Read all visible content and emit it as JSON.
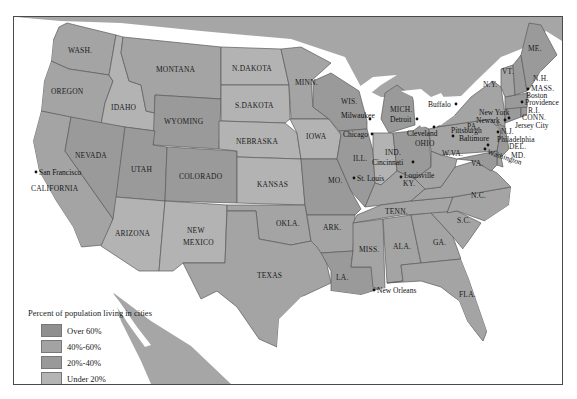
{
  "legend": {
    "title": "Percent of population living in cities",
    "items": [
      {
        "label": "Over 60%",
        "color": "#8f8f8f"
      },
      {
        "label": "40%-60%",
        "color": "#a3a3a3"
      },
      {
        "label": "20%-40%",
        "color": "#999999"
      },
      {
        "label": "Under 20%",
        "color": "#b4b4b4"
      }
    ],
    "cities_note": "Cities with population over 100,000"
  },
  "colors": {
    "over60": "#8e8e8e",
    "40to60": "#a4a4a4",
    "20to40": "#9a9a9a",
    "under20": "#b3b3b3",
    "water": "#ffffff"
  },
  "states": [
    {
      "name": "WASH.",
      "category": "40to60"
    },
    {
      "name": "OREGON",
      "category": "40to60"
    },
    {
      "name": "CALIFORNIA",
      "category": "40to60"
    },
    {
      "name": "IDAHO",
      "category": "under20"
    },
    {
      "name": "NEVADA",
      "category": "20to40"
    },
    {
      "name": "MONTANA",
      "category": "40to60"
    },
    {
      "name": "WYOMING",
      "category": "20to40"
    },
    {
      "name": "UTAH",
      "category": "20to40"
    },
    {
      "name": "COLORADO",
      "category": "20to40"
    },
    {
      "name": "ARIZONA",
      "category": "under20"
    },
    {
      "name": "NEW MEXICO",
      "category": "under20"
    },
    {
      "name": "N.DAKOTA",
      "category": "under20"
    },
    {
      "name": "S.DAKOTA",
      "category": "under20"
    },
    {
      "name": "NEBRASKA",
      "category": "under20"
    },
    {
      "name": "KANSAS",
      "category": "under20"
    },
    {
      "name": "OKLA.",
      "category": "40to60"
    },
    {
      "name": "TEXAS",
      "category": "40to60"
    },
    {
      "name": "MINN.",
      "category": "40to60"
    },
    {
      "name": "IOWA",
      "category": "under20"
    },
    {
      "name": "MO.",
      "category": "20to40"
    },
    {
      "name": "ARK.",
      "category": "40to60"
    },
    {
      "name": "LA.",
      "category": "20to40"
    },
    {
      "name": "WIS.",
      "category": "20to40"
    },
    {
      "name": "ILL.",
      "category": "20to40"
    },
    {
      "name": "MICH.",
      "category": "20to40"
    },
    {
      "name": "IND.",
      "category": "under20"
    },
    {
      "name": "OHIO",
      "category": "20to40"
    },
    {
      "name": "KY.",
      "category": "40to60"
    },
    {
      "name": "TENN.",
      "category": "40to60"
    },
    {
      "name": "MISS.",
      "category": "40to60"
    },
    {
      "name": "ALA.",
      "category": "40to60"
    },
    {
      "name": "GA.",
      "category": "40to60"
    },
    {
      "name": "FLA.",
      "category": "40to60"
    },
    {
      "name": "S.C.",
      "category": "40to60"
    },
    {
      "name": "N.C.",
      "category": "40to60"
    },
    {
      "name": "VA.",
      "category": "40to60"
    },
    {
      "name": "W.VA.",
      "category": "40to60"
    },
    {
      "name": "PA.",
      "category": "40to60"
    },
    {
      "name": "N.Y.",
      "category": "40to60"
    },
    {
      "name": "N.J.",
      "category": "20to40"
    },
    {
      "name": "DEL.",
      "category": "40to60"
    },
    {
      "name": "MD.",
      "category": "20to40"
    },
    {
      "name": "CONN.",
      "category": "20to40"
    },
    {
      "name": "R.I.",
      "category": "20to40"
    },
    {
      "name": "MASS.",
      "category": "20to40"
    },
    {
      "name": "VT.",
      "category": "40to60"
    },
    {
      "name": "N.H.",
      "category": "20to40"
    },
    {
      "name": "ME.",
      "category": "20to40"
    }
  ],
  "cities": [
    "San Francisco",
    "Milwaukee",
    "Chicago",
    "St. Louis",
    "Detroit",
    "Cleveland",
    "Cincinnati",
    "Louisville",
    "Buffalo",
    "Pittsburgh",
    "Baltimore",
    "Washington",
    "Philadelphia",
    "New York",
    "Newark",
    "Jersey City",
    "Providence",
    "Boston",
    "New Orleans"
  ]
}
